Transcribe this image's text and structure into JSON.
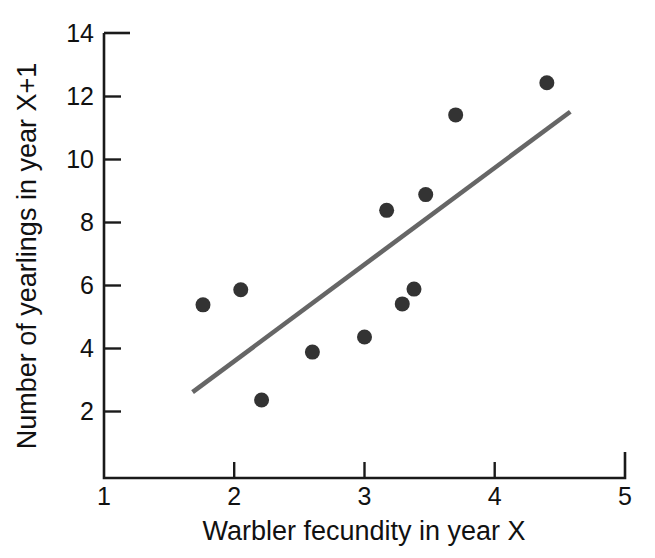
{
  "chart_data": {
    "type": "scatter",
    "title": "",
    "subtitle": "",
    "xlabel": "Warbler fecundity in year X",
    "ylabel": "Number of yearlings in year X+1",
    "xlim": [
      1,
      5
    ],
    "ylim": [
      0.95,
      14
    ],
    "xticks": [
      1,
      2,
      3,
      4,
      5
    ],
    "xticklabels": [
      "1",
      "2",
      "3",
      "4",
      "5"
    ],
    "yticks": [
      2,
      4,
      6,
      8,
      10,
      12,
      14
    ],
    "yticklabels": [
      "2",
      "4",
      "6",
      "8",
      "10",
      "12",
      "14"
    ],
    "grid": false,
    "legend": null,
    "marker_color": "#333333",
    "marker_size": 15,
    "points": [
      {
        "x": 1.76,
        "y": 5.37
      },
      {
        "x": 2.05,
        "y": 5.85
      },
      {
        "x": 2.21,
        "y": 2.35
      },
      {
        "x": 2.6,
        "y": 3.87
      },
      {
        "x": 3.0,
        "y": 4.35
      },
      {
        "x": 3.17,
        "y": 8.37
      },
      {
        "x": 3.29,
        "y": 5.4
      },
      {
        "x": 3.38,
        "y": 5.87
      },
      {
        "x": 3.47,
        "y": 8.87
      },
      {
        "x": 3.7,
        "y": 11.4
      },
      {
        "x": 4.4,
        "y": 12.42
      }
    ],
    "series": [
      {
        "name": "trendline",
        "type": "line",
        "color": "#666666",
        "x": [
          1.68,
          4.58
        ],
        "y": [
          2.6,
          11.5
        ]
      }
    ]
  },
  "axes": {
    "x_axis_name": "x-axis",
    "y_axis_name": "y-axis"
  }
}
